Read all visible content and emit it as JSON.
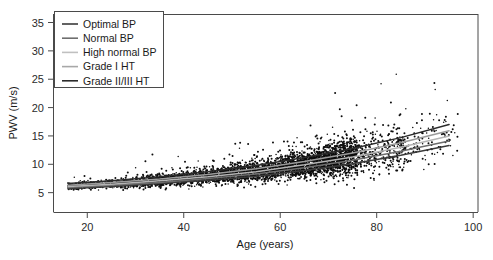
{
  "chart_data": {
    "type": "scatter",
    "title": "",
    "subtitle": "",
    "xlabel": "Age (years)",
    "ylabel": "PWV (m/s)",
    "xlim": [
      13,
      101
    ],
    "ylim": [
      1.5,
      36.5
    ],
    "xticks": [
      20,
      40,
      60,
      80,
      100
    ],
    "yticks": [
      5,
      10,
      15,
      20,
      25,
      30,
      35
    ],
    "grid": false,
    "legend_position": "top-left",
    "point_color": "#0d0d0d",
    "point_count_approx": 4000,
    "scatter_description": "Dense cloud of individual subject measurements of pulse wave velocity versus age; PWV rises with age and the spread widens markedly after age 60.",
    "series": [
      {
        "name": "Optimal BP",
        "color": "#3a3a3a",
        "type": "fit-line",
        "x": [
          16,
          25,
          35,
          45,
          55,
          65,
          75,
          85,
          95
        ],
        "y": [
          5.7,
          6.1,
          6.6,
          7.2,
          7.9,
          8.9,
          10.1,
          11.6,
          13.3
        ]
      },
      {
        "name": "Normal BP",
        "color": "#6e6e6e",
        "type": "fit-line",
        "x": [
          16,
          25,
          35,
          45,
          55,
          65,
          75,
          85,
          95
        ],
        "y": [
          5.9,
          6.3,
          6.8,
          7.5,
          8.3,
          9.4,
          10.7,
          12.3,
          14.1
        ]
      },
      {
        "name": "High normal BP",
        "color": "#b4b4b4",
        "type": "fit-line",
        "x": [
          16,
          25,
          35,
          45,
          55,
          65,
          75,
          85,
          95
        ],
        "y": [
          6.1,
          6.5,
          7.1,
          7.8,
          8.7,
          9.9,
          11.3,
          13.0,
          15.0
        ]
      },
      {
        "name": "Grade I HT",
        "color": "#9a9a9a",
        "type": "fit-line",
        "x": [
          16,
          25,
          35,
          45,
          55,
          65,
          75,
          85,
          95
        ],
        "y": [
          6.3,
          6.8,
          7.4,
          8.2,
          9.2,
          10.5,
          12.0,
          13.8,
          15.9
        ]
      },
      {
        "name": "Grade II/III HT",
        "color": "#2b2b2b",
        "type": "fit-line",
        "x": [
          16,
          25,
          35,
          45,
          55,
          65,
          75,
          85,
          95
        ],
        "y": [
          6.6,
          7.1,
          7.8,
          8.7,
          9.8,
          11.2,
          12.8,
          14.7,
          17.0
        ]
      }
    ],
    "legend_entries": [
      {
        "label": "Optimal BP",
        "color": "#3a3a3a"
      },
      {
        "label": "Normal BP",
        "color": "#6e6e6e"
      },
      {
        "label": "High normal BP",
        "color": "#c0c0c0"
      },
      {
        "label": "Grade I HT",
        "color": "#a8a8a8"
      },
      {
        "label": "Grade II/III HT",
        "color": "#2b2b2b"
      }
    ]
  }
}
